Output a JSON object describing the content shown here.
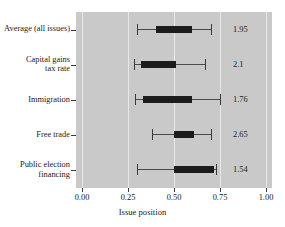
{
  "chart_data": {
    "type": "bar",
    "subtype": "box-whisker-horizontal",
    "title": "",
    "xlabel": "Issue position",
    "ylabel": "",
    "xlim": [
      0.0,
      1.0
    ],
    "grid": true,
    "legend": null,
    "xticks": [
      "0.00",
      "0.25",
      "0.50",
      "0.75",
      "1.00"
    ],
    "xtick_values": [
      0.0,
      0.25,
      0.5,
      0.75,
      1.0
    ],
    "categories": [
      "Average (all issues)",
      "Capital gains\ntax rate",
      "Immigration",
      "Free trade",
      "Public election\nfinancing"
    ],
    "rows": [
      {
        "label_line1": "Average (all issues)",
        "label_line2": "",
        "whisker_low": 0.3,
        "box_low": 0.4,
        "box_high": 0.6,
        "whisker_high": 0.7,
        "value_label": "1.95"
      },
      {
        "label_line1": "Capital gains",
        "label_line2": "tax rate",
        "whisker_low": 0.28,
        "box_low": 0.32,
        "box_high": 0.51,
        "whisker_high": 0.67,
        "value_label": "2.1"
      },
      {
        "label_line1": "Immigration",
        "label_line2": "",
        "whisker_low": 0.29,
        "box_low": 0.33,
        "box_high": 0.6,
        "whisker_high": 0.75,
        "value_label": "1.76"
      },
      {
        "label_line1": "Free trade",
        "label_line2": "",
        "whisker_low": 0.38,
        "box_low": 0.5,
        "box_high": 0.61,
        "whisker_high": 0.7,
        "value_label": "2.65"
      },
      {
        "label_line1": "Public election",
        "label_line2": "financing",
        "whisker_low": 0.3,
        "box_low": 0.5,
        "box_high": 0.72,
        "whisker_high": 0.73,
        "value_label": "1.54"
      }
    ],
    "colors": {
      "panel_background": "#c9c9c9",
      "gridline": "#e8e8e8",
      "box_fill": "#1c1c1c",
      "whisker": "#4a4a4a",
      "text": "#1a1a1a",
      "figure_background": "#ffffff"
    }
  }
}
